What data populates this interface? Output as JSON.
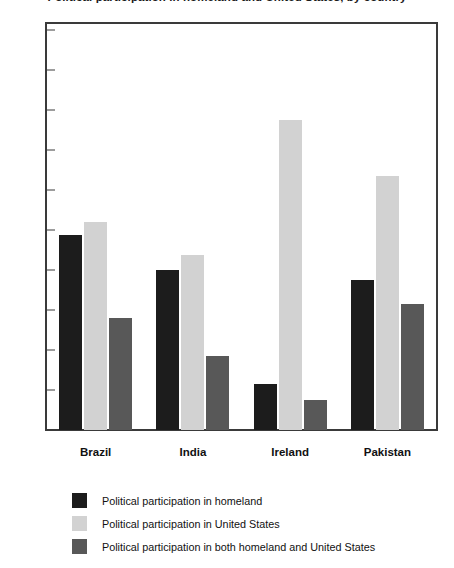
{
  "chart_data": {
    "type": "bar",
    "title": "Political participation in homeland and United States, by country",
    "xlabel": "",
    "ylabel": "",
    "categories": [
      "Brazil",
      "India",
      "Ireland",
      "Pakistan"
    ],
    "series": [
      {
        "name": "Political participation in homeland",
        "color": "#1c1c1c",
        "values": [
          24.4,
          20.0,
          5.8,
          18.8
        ]
      },
      {
        "name": "Political participation in United States",
        "color": "#d2d2d2",
        "values": [
          26.0,
          21.9,
          38.8,
          31.7
        ]
      },
      {
        "name": "Political participation in both homeland and United States",
        "color": "#585858",
        "values": [
          14.0,
          9.2,
          3.8,
          15.7
        ]
      }
    ],
    "ylim": [
      0,
      60
    ],
    "y_tick_labels": [
      "0%",
      "5%",
      "10%",
      "15%",
      "20%",
      "25%",
      "30%",
      "35%",
      "40%",
      "50%",
      "60%"
    ],
    "y_tick_values": [
      0,
      5,
      10,
      15,
      20,
      25,
      30,
      35,
      40,
      50,
      60
    ],
    "y_axis_note": "non-linear above 40%: 45% and 55% omitted",
    "grid": false,
    "legend_position": "bottom-left"
  }
}
